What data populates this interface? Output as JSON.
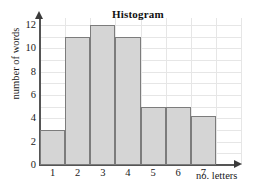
{
  "chart_data": {
    "type": "bar",
    "title": "Histogram",
    "xlabel": "no. letters",
    "ylabel": "number of words",
    "categories": [
      "1",
      "2",
      "3",
      "4",
      "5",
      "6",
      "7"
    ],
    "values": [
      3,
      11,
      12,
      11,
      5,
      5,
      4.2
    ],
    "yticks": [
      "0",
      "2",
      "4",
      "6",
      "8",
      "10",
      "12"
    ],
    "ytick_values": [
      0,
      2,
      4,
      6,
      8,
      10,
      12
    ],
    "ylim": [
      0,
      12.6
    ],
    "xlim": [
      0,
      8
    ],
    "grid": true,
    "grid_color": "#e6e6e6",
    "bar_fill": "#d5d5d5",
    "bar_edge": "#7c7c7c",
    "axis_color": "#555555",
    "legend": null
  }
}
